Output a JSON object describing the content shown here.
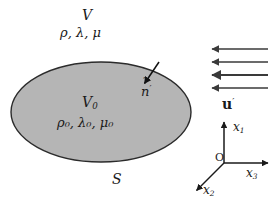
{
  "figure": {
    "background_color": "#ffffff",
    "width": 274,
    "height": 206
  },
  "region_exterior": {
    "volume_label": "V",
    "properties_label": "ρ, λ, μ"
  },
  "region_interior": {
    "volume_label": "V",
    "volume_subscript": "0",
    "properties_label": "ρ₀, λ₀, μ₀",
    "fill_color": "#b5b5b5",
    "stroke_color": "#2b2b2b",
    "ellipse": {
      "cx": 101,
      "cy": 112,
      "rx": 90,
      "ry": 50
    }
  },
  "surface": {
    "label": "S"
  },
  "normal_vector": {
    "glyph": "n",
    "accent": "˜",
    "prime": "′",
    "arrow": {
      "x1": 158,
      "y1": 63,
      "x2": 143,
      "y2": 85
    }
  },
  "incident_field": {
    "label": "u",
    "prime": "′",
    "arrow_color": "#3a3a3a",
    "arrows": [
      {
        "x_tail": 268,
        "x_head": 211,
        "y": 49
      },
      {
        "x_tail": 268,
        "x_head": 211,
        "y": 62
      },
      {
        "x_tail": 268,
        "x_head": 211,
        "y": 75
      },
      {
        "x_tail": 268,
        "x_head": 211,
        "y": 88
      }
    ]
  },
  "coordinate_axes": {
    "origin_label": "O",
    "origin": {
      "x": 224,
      "y": 163
    },
    "axes": [
      {
        "name": "x",
        "subscript": "1",
        "x2": 224,
        "y2": 122
      },
      {
        "name": "x",
        "subscript": "3",
        "x2": 268,
        "y2": 163
      },
      {
        "name": "x",
        "subscript": "2",
        "x2": 196,
        "y2": 191
      }
    ],
    "stroke_color": "#1a1a1a"
  },
  "colors": {
    "ink": "#1a1a1a",
    "inclusion_fill": "#b5b5b5",
    "inclusion_stroke": "#2b2b2b",
    "field_arrow": "#3a3a3a"
  }
}
